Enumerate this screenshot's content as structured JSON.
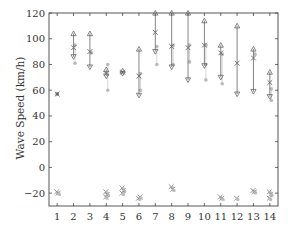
{
  "chart_data": {
    "type": "scatter",
    "title": "",
    "xlabel": "",
    "ylabel": "Wave Speed (km/h)",
    "xlim": [
      0.5,
      14.5
    ],
    "ylim": [
      -30,
      120
    ],
    "xticks": [
      1,
      2,
      3,
      4,
      5,
      6,
      7,
      8,
      9,
      10,
      11,
      12,
      13,
      14
    ],
    "yticks": [
      -20,
      0,
      20,
      40,
      60,
      80,
      100,
      120
    ],
    "grid": false,
    "legend": null,
    "categories": [
      1,
      2,
      3,
      4,
      5,
      6,
      7,
      8,
      9,
      10,
      11,
      12,
      13,
      14
    ],
    "series": [
      {
        "name": "positive-wave-range",
        "description": "vertical range bars with triangle caps (max/min) and x marker (mean)",
        "ranges": [
          {
            "x": 1,
            "max": null,
            "mean": 57,
            "min": null
          },
          {
            "x": 2,
            "max": 104,
            "mean": 93,
            "min": 86
          },
          {
            "x": 3,
            "max": 104,
            "mean": 90,
            "min": 78
          },
          {
            "x": 4,
            "max": 76,
            "mean": 73,
            "min": 71
          },
          {
            "x": 5,
            "max": 75,
            "mean": 74,
            "min": 73
          },
          {
            "x": 6,
            "max": 92,
            "mean": 71,
            "min": 56
          },
          {
            "x": 7,
            "max": 120,
            "mean": 105,
            "min": 90
          },
          {
            "x": 8,
            "max": 120,
            "mean": 94,
            "min": 78
          },
          {
            "x": 9,
            "max": 120,
            "mean": 93,
            "min": 68
          },
          {
            "x": 10,
            "max": 114,
            "mean": 95,
            "min": 79
          },
          {
            "x": 11,
            "max": 95,
            "mean": 89,
            "min": 70
          },
          {
            "x": 12,
            "max": 110,
            "mean": 81,
            "min": 57
          },
          {
            "x": 13,
            "max": 92,
            "mean": 85,
            "min": 59
          },
          {
            "x": 14,
            "max": 74,
            "mean": 66,
            "min": 55
          }
        ]
      },
      {
        "name": "secondary-estimate",
        "description": "light grey markers",
        "points": [
          {
            "x": 2,
            "values": [
              95,
              81
            ]
          },
          {
            "x": 3,
            "values": [
              89
            ]
          },
          {
            "x": 4,
            "values": [
              80,
              60
            ]
          },
          {
            "x": 6,
            "values": [
              73,
              60
            ]
          },
          {
            "x": 7,
            "values": [
              94,
              80
            ]
          },
          {
            "x": 8,
            "values": [
              95,
              80
            ]
          },
          {
            "x": 9,
            "values": [
              95,
              82
            ]
          },
          {
            "x": 10,
            "values": [
              95,
              80,
              68
            ]
          },
          {
            "x": 11,
            "values": [
              88,
              65
            ]
          },
          {
            "x": 12,
            "values": []
          },
          {
            "x": 13,
            "values": [
              88
            ]
          },
          {
            "x": 14,
            "values": [
              61,
              52
            ]
          }
        ]
      },
      {
        "name": "negative-wave",
        "description": "clusters of markers near -20",
        "points": [
          {
            "x": 1,
            "values": [
              -19,
              -20
            ]
          },
          {
            "x": 4,
            "values": [
              -19,
              -21,
              -23
            ]
          },
          {
            "x": 5,
            "values": [
              -16,
              -18,
              -20
            ]
          },
          {
            "x": 6,
            "values": [
              -24,
              -23
            ]
          },
          {
            "x": 8,
            "values": [
              -15,
              -17
            ]
          },
          {
            "x": 11,
            "values": [
              -23,
              -24
            ]
          },
          {
            "x": 12,
            "values": [
              -24
            ]
          },
          {
            "x": 13,
            "values": [
              -18,
              -19
            ]
          },
          {
            "x": 14,
            "values": [
              -19,
              -21,
              -24
            ]
          }
        ]
      }
    ]
  },
  "labels": {
    "ylabel": "Wave Speed (km/h)",
    "yticks": [
      "-20",
      "0",
      "20",
      "40",
      "60",
      "80",
      "100",
      "120"
    ],
    "xticks": [
      "1",
      "2",
      "3",
      "4",
      "5",
      "6",
      "7",
      "8",
      "9",
      "10",
      "11",
      "12",
      "13",
      "14"
    ]
  }
}
